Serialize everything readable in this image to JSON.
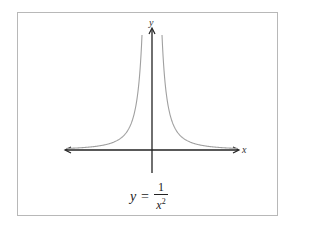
{
  "chart_data": {
    "type": "line",
    "title": "",
    "caption": "y = 1/x^2",
    "function": "y = 1/x^2",
    "xlabel": "x",
    "ylabel": "y",
    "grid": false,
    "legend": null,
    "axes": {
      "x_arrows_both_ends": true,
      "y_arrow_top": true
    },
    "series": [
      {
        "name": "y = 1/x^2 (x<0)",
        "color": "#a0a0a0",
        "x": [
          -8.5,
          -6,
          -5,
          -4,
          -3,
          -2,
          -1.5,
          -1.2,
          -1.0
        ],
        "y": [
          0.014,
          0.028,
          0.04,
          0.063,
          0.111,
          0.25,
          0.444,
          0.694,
          1.0
        ]
      },
      {
        "name": "y = 1/x^2 (x>0)",
        "color": "#a0a0a0",
        "x": [
          1.0,
          1.2,
          1.5,
          2,
          3,
          4,
          5,
          6,
          8.5
        ],
        "y": [
          1.0,
          0.694,
          0.444,
          0.25,
          0.111,
          0.063,
          0.04,
          0.028,
          0.014
        ]
      }
    ]
  },
  "labels": {
    "x_axis": "x",
    "y_axis": "y",
    "formula_lhs": "y",
    "formula_eq": "=",
    "formula_num": "1",
    "formula_den": "x",
    "formula_exp": "2"
  },
  "colors": {
    "axis": "#222222",
    "curve": "#a0a0a0",
    "frame": "#b8b8b8"
  }
}
